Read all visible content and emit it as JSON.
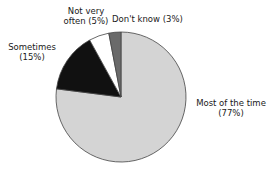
{
  "chart_data": {
    "type": "pie",
    "title": "",
    "categories": [
      "Most of the time",
      "Sometimes",
      "Not very often",
      "Don't know"
    ],
    "values": [
      77,
      15,
      5,
      3
    ],
    "unit": "%",
    "colors": [
      "#d4d4d4",
      "#111111",
      "#ffffff",
      "#6a6a6a"
    ],
    "start_angle_deg": 0,
    "direction": "clockwise",
    "labels": [
      {
        "line1": "Most of the time",
        "line2": "(77%)"
      },
      {
        "line1": "Sometimes",
        "line2": "(15%)"
      },
      {
        "line1": "Not very",
        "line2": "often (5%)"
      },
      {
        "line1": "Don't know (3%)",
        "line2": ""
      }
    ],
    "legend": "none"
  }
}
